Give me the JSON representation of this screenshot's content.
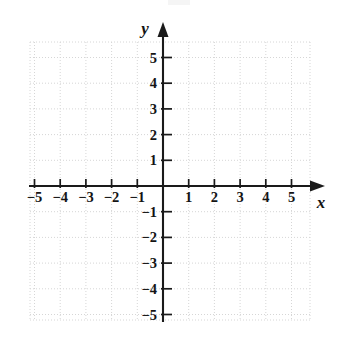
{
  "figure": {
    "type": "coordinate-plane",
    "title": "",
    "background_color": "#ffffff",
    "axis_color": "#1a1a1a",
    "grid_color": "#d6d6d6"
  },
  "axes": {
    "x": {
      "label": "x",
      "label_style": "italic-serif",
      "min": -5.2,
      "max": 6.3,
      "tick_values": [
        -5,
        -4,
        -3,
        -2,
        -1,
        1,
        2,
        3,
        4,
        5
      ],
      "tick_labels": [
        "−5",
        "−4",
        "−3",
        "−2",
        "−1",
        "1",
        "2",
        "3",
        "4",
        "5"
      ],
      "arrow": "right"
    },
    "y": {
      "label": "y",
      "label_style": "italic-serif",
      "min": -5.3,
      "max": 6.4,
      "tick_values": [
        5,
        4,
        3,
        2,
        1,
        -1,
        -2,
        -3,
        -4,
        -5
      ],
      "tick_labels": [
        "5",
        "4",
        "3",
        "2",
        "1",
        "−1",
        "−2",
        "−3",
        "−4",
        "−5"
      ],
      "arrow": "up"
    }
  },
  "chart_data": {
    "type": "scatter",
    "title": "",
    "xlabel": "x",
    "ylabel": "y",
    "x": [],
    "y": [],
    "series": [],
    "categories": [],
    "values": [],
    "xlim": [
      -5.2,
      6.3
    ],
    "ylim": [
      -5.3,
      6.4
    ],
    "xticks": [
      -5,
      -4,
      -3,
      -2,
      -1,
      1,
      2,
      3,
      4,
      5
    ],
    "yticks": [
      -5,
      -4,
      -3,
      -2,
      -1,
      1,
      2,
      3,
      4,
      5
    ],
    "grid": true,
    "grid_style": "dotted",
    "legend": "none",
    "annotations": [],
    "note": "Empty coordinate grid with no plotted data points or curves."
  },
  "geometry": {
    "origin_x": 163,
    "origin_y": 186,
    "unit_px": 25.7,
    "grid_left": 30,
    "grid_right": 310,
    "grid_top": 42,
    "grid_bottom": 320,
    "x_axis_start": 29,
    "x_axis_end": 325,
    "y_axis_top": 22,
    "y_axis_end": 322
  }
}
